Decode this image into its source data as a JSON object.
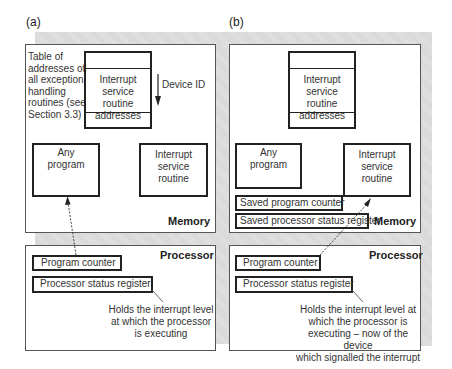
{
  "panels": {
    "a": {
      "label": "(a)",
      "memory": {
        "title": "Memory",
        "table_note": [
          "Table of",
          "addresses of",
          "all exception",
          "handling",
          "routines (see",
          "Section 3.3)"
        ],
        "table_entry": [
          "Interrupt",
          "service routine",
          "addresses"
        ],
        "device_id_label": "Device ID",
        "any_program": [
          "Any",
          "program"
        ],
        "isr": [
          "Interrupt",
          "service",
          "routine"
        ]
      },
      "processor": {
        "title": "Processor",
        "program_counter": "Program counter",
        "status_register": "Processor status register",
        "note": [
          "Holds the interrupt level",
          "at which the processor",
          "is executing"
        ]
      }
    },
    "b": {
      "label": "(b)",
      "memory": {
        "title": "Memory",
        "table_entry": [
          "Interrupt",
          "service routine",
          "addresses"
        ],
        "any_program": [
          "Any",
          "program"
        ],
        "isr": [
          "Interrupt",
          "service",
          "routine"
        ],
        "saved_pc": "Saved program counter",
        "saved_psr": "Saved processor status register"
      },
      "processor": {
        "title": "Processor",
        "program_counter": "Program counter",
        "status_register": "Processor status register",
        "note": [
          "Holds the interrupt level at",
          "which the processor is",
          "executing – now of the device",
          "which signalled the interrupt"
        ]
      }
    }
  },
  "colors": {
    "line": "#222222",
    "shade": "#dcdcdc",
    "background": "#ffffff"
  }
}
